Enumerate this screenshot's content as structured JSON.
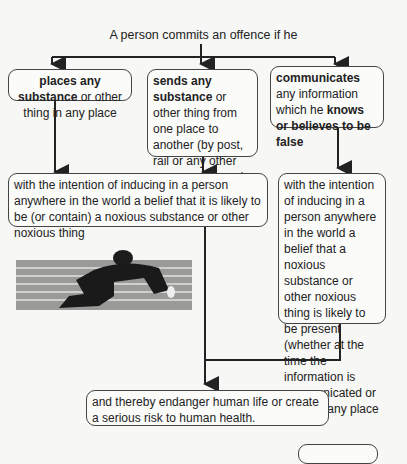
{
  "diagram": {
    "title": "A person commits an offence if he",
    "act_boxes": [
      {
        "bold": "places any substance",
        "rest": " or other thing in any place"
      },
      {
        "bold": "sends any substance",
        "rest": " or other thing from one place to another (by post, rail or any other means whatever)"
      },
      {
        "bold1": "communicates",
        "mid": " any information which he ",
        "bold2": "knows or believes to be false"
      }
    ],
    "intent_box_left": "with the intention of inducing in a person anywhere in the world a belief that it is likely to be (or contain) a noxious substance or other noxious thing",
    "intent_box_right": "with the intention of inducing in a person anywhere in the world a belief that a noxious substance or other noxious thing is likely to be present (whether at the time the information is communicated or later) in any place",
    "result_box": "and thereby endanger human life or create a serious risk to human health.",
    "illustration": "man-lying-on-steps-image"
  }
}
